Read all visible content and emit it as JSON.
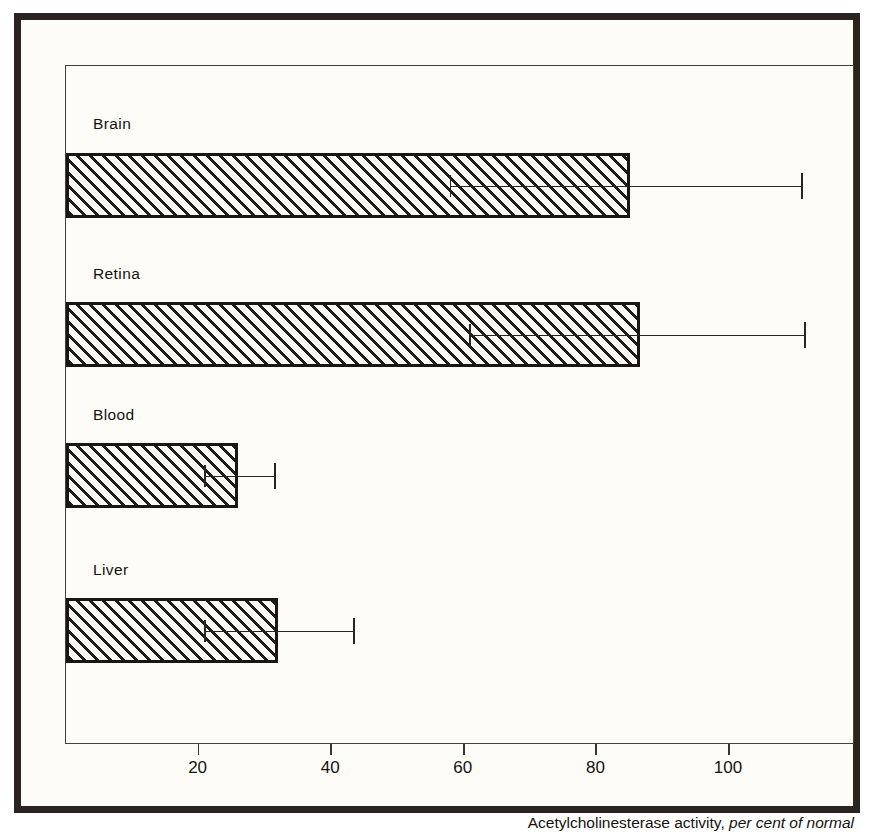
{
  "chart_data": {
    "type": "bar",
    "orientation": "horizontal",
    "title": "",
    "xlabel": "Acetylcholinesterase activity, per cent of normal",
    "xlabel_plain": "Acetylcholinesterase activity,",
    "xlabel_italic": "per cent of normal",
    "ylabel": "",
    "xlim": [
      0,
      119
    ],
    "xticks": [
      20,
      40,
      60,
      80,
      100
    ],
    "xtick_labels": [
      "20",
      "40",
      "60",
      "80",
      "100"
    ],
    "grid": false,
    "legend": null,
    "categories": [
      "Brain",
      "Retina",
      "Blood",
      "Liver"
    ],
    "values": [
      85,
      86.5,
      26,
      32
    ],
    "error_low": [
      58,
      61,
      21,
      21
    ],
    "error_high": [
      111,
      111.5,
      31.5,
      43.5
    ],
    "bars": [
      {
        "label": "Brain",
        "value": 85,
        "error_low": 58,
        "error_high": 111
      },
      {
        "label": "Retina",
        "value": 86.5,
        "error_low": 61,
        "error_high": 111.5
      },
      {
        "label": "Blood",
        "value": 26,
        "error_low": 21,
        "error_high": 31.5
      },
      {
        "label": "Liver",
        "value": 32,
        "error_low": 21,
        "error_high": 43.5
      }
    ],
    "colors": {
      "bar_fill": "#fbfaf4",
      "bar_hatch": "#211b18",
      "bar_edge": "#1b1613",
      "axis": "#45403c",
      "text": "#17120f",
      "outer_frame": "#2b2320",
      "page_background": "#fdfcf7"
    }
  }
}
